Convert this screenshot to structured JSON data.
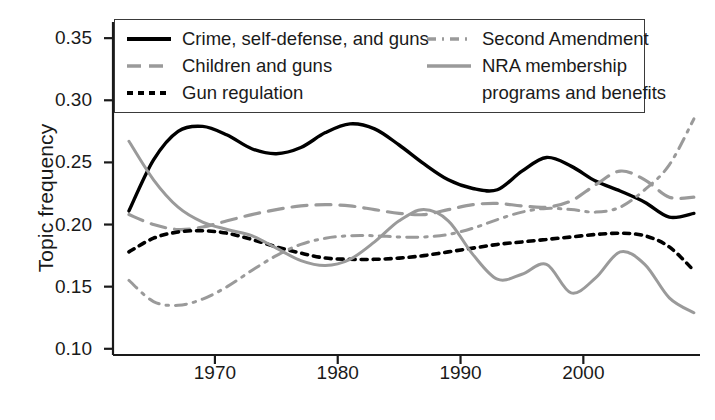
{
  "chart_data": {
    "type": "line",
    "title": "",
    "subtitle": "",
    "xlabel": "",
    "ylabel": "Topic frequency",
    "xlim": [
      1961.7,
      2009.5
    ],
    "ylim": [
      0.095,
      0.363
    ],
    "grid": false,
    "legend_position": "top-inside",
    "x_ticks": [
      "1970",
      "1980",
      "1990",
      "2000"
    ],
    "x_tick_values": [
      1970,
      1980,
      1990,
      2000
    ],
    "y_ticks": [
      "0.10",
      "0.15",
      "0.20",
      "0.25",
      "0.30",
      "0.35"
    ],
    "y_tick_values": [
      0.1,
      0.15,
      0.2,
      0.25,
      0.3,
      0.35
    ],
    "x": [
      1963,
      1965,
      1967,
      1969,
      1971,
      1973,
      1975,
      1977,
      1979,
      1981,
      1983,
      1985,
      1987,
      1989,
      1991,
      1993,
      1995,
      1997,
      1999,
      2001,
      2003,
      2005,
      2007,
      2009
    ],
    "series": [
      {
        "name": "Crime, self-defense, and guns",
        "style": "solid",
        "color": "#000000",
        "width": 3.4,
        "values": [
          0.211,
          0.252,
          0.275,
          0.279,
          0.272,
          0.261,
          0.257,
          0.262,
          0.274,
          0.281,
          0.277,
          0.264,
          0.249,
          0.236,
          0.229,
          0.228,
          0.243,
          0.254,
          0.247,
          0.235,
          0.227,
          0.218,
          0.206,
          0.209
        ]
      },
      {
        "name": "Children and guns",
        "style": "dashed",
        "color": "#9a9a9a",
        "width": 3.2,
        "values": [
          0.208,
          0.2,
          0.196,
          0.198,
          0.203,
          0.208,
          0.212,
          0.215,
          0.216,
          0.215,
          0.212,
          0.209,
          0.208,
          0.212,
          0.216,
          0.217,
          0.215,
          0.214,
          0.219,
          0.232,
          0.243,
          0.236,
          0.222,
          0.222
        ]
      },
      {
        "name": "Gun regulation",
        "style": "dotted",
        "color": "#000000",
        "width": 3.6,
        "values": [
          0.178,
          0.189,
          0.194,
          0.195,
          0.193,
          0.188,
          0.182,
          0.177,
          0.173,
          0.172,
          0.172,
          0.173,
          0.175,
          0.178,
          0.181,
          0.184,
          0.186,
          0.188,
          0.19,
          0.192,
          0.193,
          0.191,
          0.182,
          0.163
        ]
      },
      {
        "name": "Second Amendment",
        "style": "dashdot",
        "color": "#9a9a9a",
        "width": 3.0,
        "values": [
          0.155,
          0.138,
          0.135,
          0.14,
          0.15,
          0.163,
          0.175,
          0.184,
          0.189,
          0.191,
          0.191,
          0.19,
          0.19,
          0.192,
          0.197,
          0.204,
          0.21,
          0.213,
          0.212,
          0.21,
          0.214,
          0.228,
          0.248,
          0.285
        ]
      },
      {
        "name": "NRA membership programs and benefits",
        "style": "solid",
        "color": "#9a9a9a",
        "width": 3.0,
        "values": [
          0.267,
          0.236,
          0.214,
          0.202,
          0.196,
          0.191,
          0.181,
          0.171,
          0.167,
          0.172,
          0.186,
          0.203,
          0.212,
          0.203,
          0.176,
          0.156,
          0.16,
          0.168,
          0.145,
          0.157,
          0.178,
          0.168,
          0.141,
          0.129
        ]
      }
    ]
  },
  "axis": {
    "y_title": "Topic frequency"
  },
  "legend": {
    "entries": [
      {
        "label": "Crime, self-defense, and guns",
        "swatch": "solid-black-line"
      },
      {
        "label": "Children and guns",
        "swatch": "dashed-gray-line"
      },
      {
        "label": "Gun regulation",
        "swatch": "dotted-black-line"
      },
      {
        "label": "Second Amendment",
        "swatch": "dashdot-gray-line"
      },
      {
        "label": "NRA membership",
        "swatch": "solid-gray-line"
      },
      {
        "label": "programs and benefits",
        "swatch": "none"
      }
    ]
  }
}
